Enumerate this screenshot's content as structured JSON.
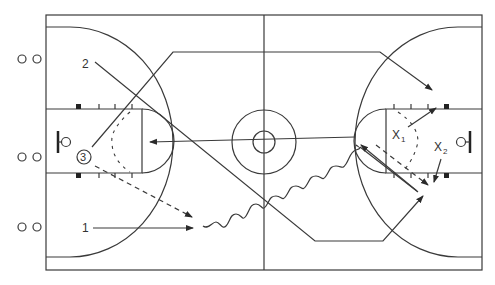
{
  "diagram": {
    "type": "basketball-play-diagram",
    "court": {
      "left": 46,
      "top": 15,
      "right": 482,
      "bottom": 270,
      "midcourt_x": 264,
      "center_y": 142
    },
    "colors": {
      "line": "#3a3a3a",
      "background": "#ffffff"
    },
    "offense_labels": {
      "player1": "1",
      "player2": "2",
      "player3": "3"
    },
    "defense_labels": {
      "x1_main": "X",
      "x1_sub": "1",
      "x2_main": "X",
      "x2_sub": "2"
    },
    "bench_marks": [
      {
        "row": "top",
        "symbol": "o o"
      },
      {
        "row": "middle",
        "symbol": "o o"
      },
      {
        "row": "bottom",
        "symbol": "o o"
      }
    ],
    "legend_icons": [
      "solid-arrow-cut",
      "dashed-arrow-pass",
      "wavy-arrow-dribble",
      "screen"
    ]
  }
}
